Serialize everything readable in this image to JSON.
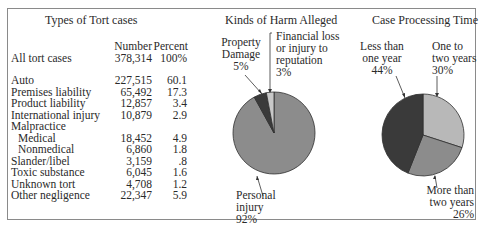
{
  "table": {
    "title": "Types of Tort cases",
    "headers": {
      "number": "Number",
      "percent": "Percent"
    },
    "total": {
      "label": "All tort cases",
      "number": "378,314",
      "percent": "100%"
    },
    "rows": [
      {
        "label": "Auto",
        "number": "227,515",
        "percent": "60.1"
      },
      {
        "label": "Premises liability",
        "number": "65,492",
        "percent": "17.3"
      },
      {
        "label": "Product liability",
        "number": "12,857",
        "percent": "3.4"
      },
      {
        "label": "International injury",
        "number": "10,879",
        "percent": "2.9"
      },
      {
        "label": "Malpractice",
        "number": "",
        "percent": ""
      },
      {
        "label": "Medical",
        "number": "18,452",
        "percent": "4.9"
      },
      {
        "label": "Nonmedical",
        "number": "6,860",
        "percent": "1.8"
      },
      {
        "label": "Slander/libel",
        "number": "3,159",
        "percent": ".8"
      },
      {
        "label": "Toxic substance",
        "number": "6,045",
        "percent": "1.6"
      },
      {
        "label": "Unknown tort",
        "number": "4,708",
        "percent": "1.2"
      },
      {
        "label": "Other negligence",
        "number": "22,347",
        "percent": "5.9"
      }
    ]
  },
  "harm": {
    "title": "Kinds of Harm Alleged",
    "labels": {
      "property_1": "Property",
      "property_2": "Damage",
      "property_3": "5%",
      "financial_1": "Financial loss",
      "financial_2": "or injury to",
      "financial_3": "reputation",
      "financial_4": "3%",
      "personal_1": "Personal",
      "personal_2": "injury",
      "personal_3": "92%"
    }
  },
  "time": {
    "title": "Case Processing Time",
    "labels": {
      "less_1": "Less than",
      "less_2": "one year",
      "less_3": "44%",
      "one_1": "One to",
      "one_2": "two years",
      "one_3": "30%",
      "more_1": "More than",
      "more_2": "two years",
      "more_3": "26%"
    }
  },
  "colors": {
    "dark": "#3a3a3a",
    "medium": "#8c8c8c",
    "light": "#b8b8b8",
    "lightest": "#c8c8c8"
  },
  "chart_data": [
    {
      "type": "table",
      "title": "Types of Tort cases",
      "columns": [
        "Type",
        "Number",
        "Percent"
      ],
      "rows": [
        [
          "All tort cases",
          378314,
          100
        ],
        [
          "Auto",
          227515,
          60.1
        ],
        [
          "Premises liability",
          65492,
          17.3
        ],
        [
          "Product liability",
          12857,
          3.4
        ],
        [
          "International injury",
          10879,
          2.9
        ],
        [
          "Malpractice - Medical",
          18452,
          4.9
        ],
        [
          "Malpractice - Nonmedical",
          6860,
          1.8
        ],
        [
          "Slander/libel",
          3159,
          0.8
        ],
        [
          "Toxic substance",
          6045,
          1.6
        ],
        [
          "Unknown tort",
          4708,
          1.2
        ],
        [
          "Other negligence",
          22347,
          5.9
        ]
      ]
    },
    {
      "type": "pie",
      "title": "Kinds of Harm Alleged",
      "categories": [
        "Personal injury",
        "Property Damage",
        "Financial loss or injury to reputation"
      ],
      "values": [
        92,
        5,
        3
      ]
    },
    {
      "type": "pie",
      "title": "Case Processing Time",
      "categories": [
        "Less than one year",
        "One to two years",
        "More than two years"
      ],
      "values": [
        44,
        30,
        26
      ]
    }
  ]
}
